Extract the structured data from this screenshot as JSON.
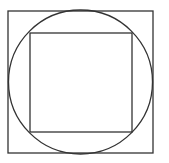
{
  "diagram": {
    "stroke_color": "#333333",
    "background": "#ffffff",
    "outer_square": {
      "x": 8,
      "y": 11,
      "width": 145,
      "height": 142
    },
    "circle": {
      "cx": 80.5,
      "cy": 82,
      "r": 72
    },
    "inner_square": {
      "x": 30,
      "y": 33,
      "width": 102,
      "height": 99
    }
  }
}
